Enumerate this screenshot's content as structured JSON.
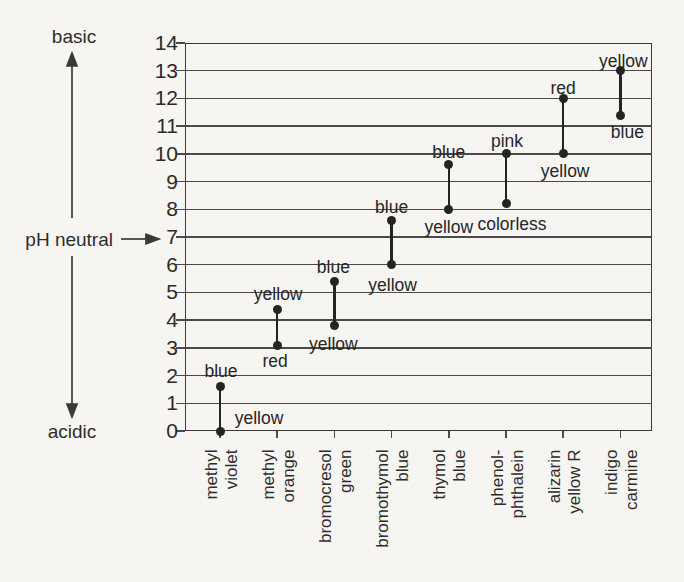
{
  "colors": {
    "ink": "#2d2d2d",
    "line": "#4a4a4a",
    "mark": "#242424",
    "background": "#f6f5f1"
  },
  "chart_data": {
    "type": "scatter",
    "variant": "dumbbell-range",
    "title": "",
    "xlabel": "",
    "ylabel": "",
    "ylim": [
      0,
      14
    ],
    "yticks": [
      14,
      13,
      12,
      11,
      10,
      9,
      8,
      7,
      6,
      5,
      4,
      3,
      2,
      1,
      0
    ],
    "grid": "horizontal, every integer pH",
    "legend": "none",
    "axis_annotations": {
      "basic": "basic",
      "acidic": "acidic",
      "ph_neutral": "pH neutral",
      "neutral_ph": 7
    },
    "categories": [
      "methyl violet",
      "methyl orange",
      "bromocresol green",
      "bromothymol blue",
      "thymol blue",
      "phenolphthalein",
      "alizarin yellow R",
      "indigo carmine"
    ],
    "indicators": [
      {
        "name": "methyl violet",
        "axis_label": "methyl\nviolet",
        "low_ph": 0.0,
        "high_ph": 1.6,
        "low_color": "yellow",
        "high_color": "blue"
      },
      {
        "name": "methyl orange",
        "axis_label": "methyl\norange",
        "low_ph": 3.1,
        "high_ph": 4.4,
        "low_color": "red",
        "high_color": "yellow"
      },
      {
        "name": "bromocresol green",
        "axis_label": "bromocresol\ngreen",
        "low_ph": 3.8,
        "high_ph": 5.4,
        "low_color": "yellow",
        "high_color": "blue"
      },
      {
        "name": "bromothymol blue",
        "axis_label": "bromothymol\nblue",
        "low_ph": 6.0,
        "high_ph": 7.6,
        "low_color": "yellow",
        "high_color": "blue"
      },
      {
        "name": "thymol blue",
        "axis_label": "thymol\nblue",
        "low_ph": 8.0,
        "high_ph": 9.6,
        "low_color": "yellow",
        "high_color": "blue"
      },
      {
        "name": "phenolphthalein",
        "axis_label": "phenol-\nphthalein",
        "low_ph": 8.2,
        "high_ph": 10.0,
        "low_color": "colorless",
        "high_color": "pink"
      },
      {
        "name": "alizarin yellow R",
        "axis_label": "alizarin\nyellow R",
        "low_ph": 10.0,
        "high_ph": 12.0,
        "low_color": "yellow",
        "high_color": "red"
      },
      {
        "name": "indigo carmine",
        "axis_label": "indigo\ncarmine",
        "low_ph": 11.4,
        "high_ph": 13.0,
        "low_color": "blue",
        "high_color": "yellow"
      }
    ]
  }
}
